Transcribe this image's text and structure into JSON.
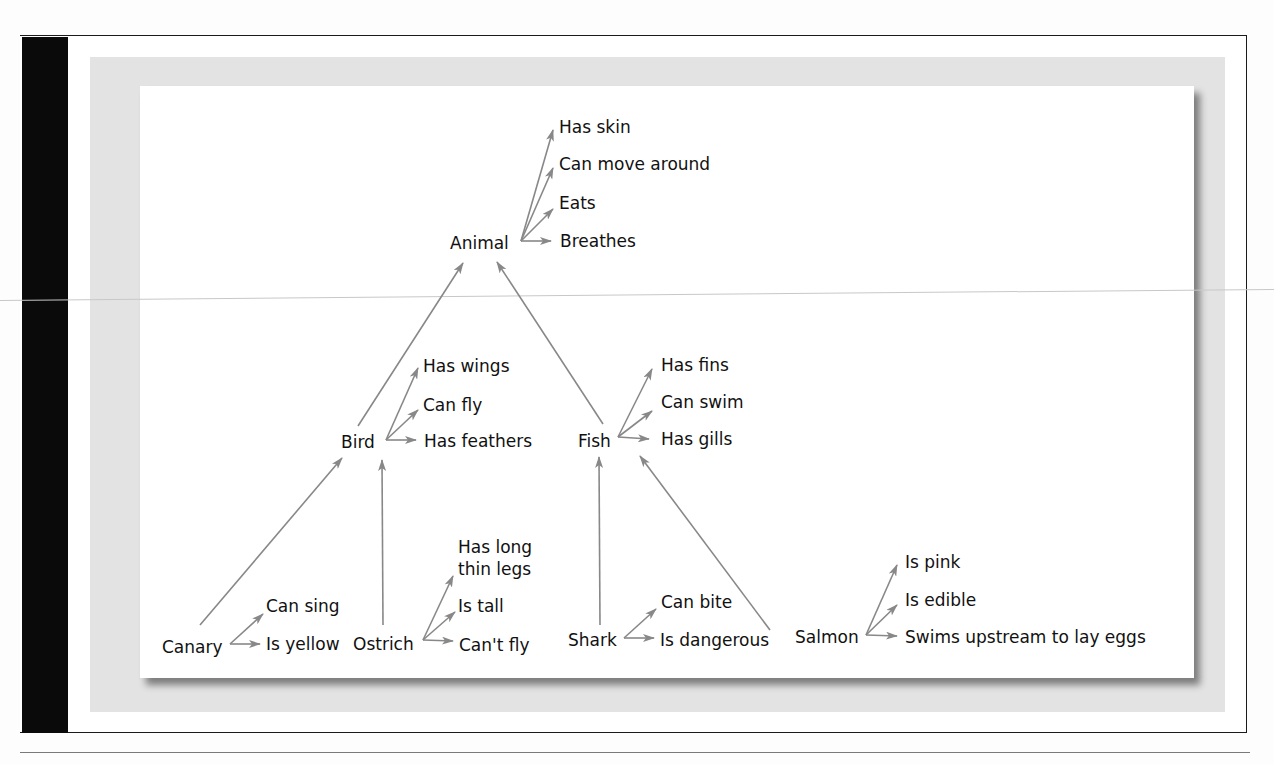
{
  "diagram": {
    "type": "semantic-network-hierarchy",
    "arrow_color": "#888888",
    "text_color": "#111111",
    "nodes": {
      "animal": {
        "label": "Animal",
        "properties": [
          "Has skin",
          "Can move around",
          "Eats",
          "Breathes"
        ]
      },
      "bird": {
        "label": "Bird",
        "properties": [
          "Has wings",
          "Can fly",
          "Has feathers"
        ]
      },
      "fish": {
        "label": "Fish",
        "properties": [
          "Has fins",
          "Can swim",
          "Has gills"
        ]
      },
      "canary": {
        "label": "Canary",
        "properties": [
          "Can sing",
          "Is yellow"
        ]
      },
      "ostrich": {
        "label": "Ostrich",
        "properties": [
          "Has long",
          "thin legs",
          "Is tall",
          "Can't fly"
        ]
      },
      "shark": {
        "label": "Shark",
        "properties": [
          "Can bite",
          "Is dangerous"
        ]
      },
      "salmon": {
        "label": "Salmon",
        "properties": [
          "Is pink",
          "Is edible",
          "Swims upstream to lay eggs"
        ]
      }
    },
    "edges": [
      {
        "from": "Bird",
        "to": "Animal"
      },
      {
        "from": "Fish",
        "to": "Animal"
      },
      {
        "from": "Canary",
        "to": "Bird"
      },
      {
        "from": "Ostrich",
        "to": "Bird"
      },
      {
        "from": "Shark",
        "to": "Fish"
      },
      {
        "from": "Salmon",
        "to": "Fish"
      }
    ]
  }
}
